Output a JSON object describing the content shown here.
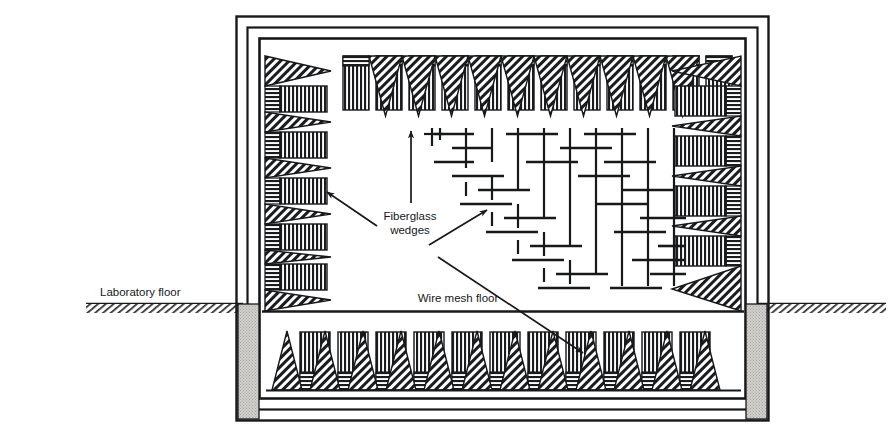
{
  "figure": {
    "type": "technical-line-diagram",
    "background_color": "#ffffff",
    "ink_color": "#17181a",
    "pedestal_color": "#c9c7c4"
  },
  "labels": {
    "laboratory_floor": "Laboratory floor",
    "fiberglass_wedges_line1": "Fiberglass",
    "fiberglass_wedges_line2": "wedges",
    "wire_mesh_floor": "Wire mesh floor"
  },
  "structure": {
    "outer_shell_rings": 3,
    "chamber_wall_label": "chamber inner wall",
    "wedge_rows": [
      {
        "name": "ceiling-wedges",
        "orientation": "down",
        "count": 12
      },
      {
        "name": "left-wall-wedges",
        "orientation": "right",
        "count": 7
      },
      {
        "name": "right-wall-wedges",
        "orientation": "left",
        "count": 7
      },
      {
        "name": "floor-wedges",
        "orientation": "up",
        "count": 13
      }
    ],
    "mesh": {
      "name": "wire-mesh-floor",
      "pattern": "woven grid",
      "edge": "diagonal"
    },
    "pedestals": [
      {
        "name": "left-pedestal"
      },
      {
        "name": "right-pedestal"
      }
    ],
    "ground_line": {
      "name": "laboratory-floor-line",
      "hatched": true
    }
  }
}
